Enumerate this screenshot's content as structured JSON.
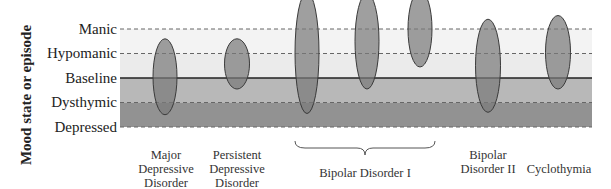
{
  "y_axis_label": "Mood state or episode",
  "levels": [
    {
      "key": "manic",
      "label": "Manic",
      "line": "dashed"
    },
    {
      "key": "hypomanic",
      "label": "Hypomanic",
      "line": "dashed"
    },
    {
      "key": "baseline",
      "label": "Baseline",
      "line": "solid"
    },
    {
      "key": "dysthymic",
      "label": "Dysthymic",
      "line": "dashed"
    },
    {
      "key": "depressed",
      "label": "Depressed",
      "line": "dashed"
    }
  ],
  "bands": [
    {
      "from": "manic",
      "to": "hypomanic",
      "color": "#f3f3f3"
    },
    {
      "from": "hypomanic",
      "to": "baseline",
      "color": "#ebebeb"
    },
    {
      "from": "baseline",
      "to": "dysthymic",
      "color": "#b8b8b8"
    },
    {
      "from": "dysthymic",
      "to": "depressed",
      "color": "#929292"
    }
  ],
  "episode_color": "#7a7a7a",
  "episodes": [
    {
      "group": "Major Depressive Disorder",
      "upper": 3.6,
      "lower": 0.5
    },
    {
      "group": "Persistent Depressive Disorder",
      "upper": 3.6,
      "lower": 1.55
    },
    {
      "group": "Bipolar Disorder I",
      "upper": 5.5,
      "lower": 0.55
    },
    {
      "group": "Bipolar Disorder I",
      "upper": 5.45,
      "lower": 1.55
    },
    {
      "group": "Bipolar Disorder I",
      "upper": 5.55,
      "lower": 2.45
    },
    {
      "group": "Bipolar Disorder II",
      "upper": 4.4,
      "lower": 0.6
    },
    {
      "group": "Cyclothymia",
      "upper": 4.55,
      "lower": 1.55
    }
  ],
  "categories": [
    {
      "name": "mdd",
      "lines": [
        "Major",
        "Depressive",
        "Disorder"
      ]
    },
    {
      "name": "pdd",
      "lines": [
        "Persistent",
        "Depressive",
        "Disorder"
      ]
    },
    {
      "name": "bipolar-1",
      "lines": [
        "Bipolar Disorder I"
      ]
    },
    {
      "name": "bipolar-2",
      "lines": [
        "Bipolar",
        "Disorder II"
      ]
    },
    {
      "name": "cyclothymia",
      "lines": [
        "Cyclothymia"
      ]
    }
  ]
}
